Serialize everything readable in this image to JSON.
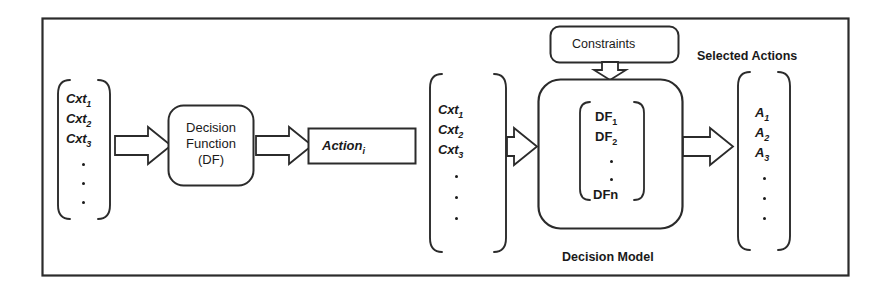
{
  "diagram": {
    "title_bottom": "Decision Model",
    "left_branch": {
      "input_vector": {
        "name": "context-vector-left",
        "items": [
          "Cxt",
          "Cxt",
          "Cxt"
        ],
        "subscripts": [
          "1",
          "2",
          "3"
        ],
        "ellipsis_dots": 3
      },
      "process_box": {
        "line1": "Decision",
        "line2": "Function",
        "line3": "(DF)"
      },
      "output_box": {
        "label": "Action",
        "subscript": "i"
      }
    },
    "right_branch": {
      "input_vector": {
        "name": "context-vector-right",
        "items": [
          "Cxt",
          "Cxt",
          "Cxt"
        ],
        "subscripts": [
          "1",
          "2",
          "3"
        ],
        "ellipsis_dots": 3
      },
      "constraints_box": {
        "label": "Constraints"
      },
      "decision_model_box": {
        "inner_vector": {
          "items": [
            "DF",
            "DF",
            "DFn"
          ],
          "subscripts": [
            "1",
            "2",
            ""
          ],
          "ellipsis_dots": 2
        }
      },
      "output_label": "Selected Actions",
      "output_vector": {
        "name": "selected-actions-vector",
        "items": [
          "A",
          "A",
          "A"
        ],
        "subscripts": [
          "1",
          "2",
          "3"
        ],
        "ellipsis_dots": 3
      }
    },
    "colors": {
      "stroke": "#2b2b2b",
      "background": "#ffffff",
      "text": "#1a1a1a"
    }
  }
}
